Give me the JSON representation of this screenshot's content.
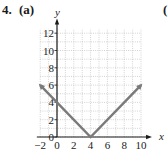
{
  "problem": {
    "number": "4.",
    "part": "(a)",
    "next_part": "("
  },
  "chart_data": {
    "type": "line",
    "title": "",
    "xlabel": "x",
    "ylabel": "y",
    "xlim": [
      -2,
      10
    ],
    "ylim": [
      0,
      12
    ],
    "grid": true,
    "x_ticks": [
      -2,
      0,
      2,
      4,
      6,
      8,
      10
    ],
    "y_ticks": [
      0,
      2,
      4,
      6,
      8,
      10,
      12
    ],
    "x_tick_labels": [
      "−2",
      "0",
      "2",
      "4",
      "6",
      "8",
      "10"
    ],
    "y_tick_labels": [
      "0",
      "2",
      "4",
      "6",
      "8",
      "10",
      "12"
    ],
    "series": [
      {
        "name": "y = |x − 4|",
        "x": [
          -2,
          4,
          10
        ],
        "y": [
          6,
          0,
          6
        ],
        "arrows": "both-ends",
        "color": "#7a7a7a"
      }
    ],
    "colors": {
      "axis": "#1a1a1a",
      "grid": "#b5b5b5",
      "line": "#7a7a7a"
    }
  }
}
